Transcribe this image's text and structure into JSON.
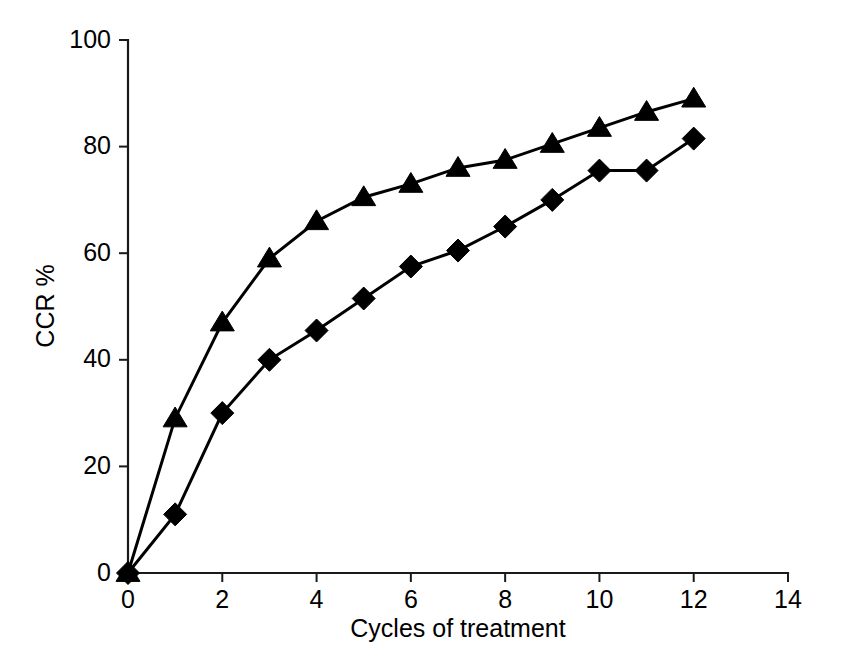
{
  "chart_data": {
    "type": "line",
    "title": "",
    "subtitle": "",
    "xlabel": "Cycles of treatment",
    "ylabel": "CCR %",
    "xlim": [
      0,
      14
    ],
    "ylim": [
      0,
      100
    ],
    "xticks": [
      0,
      2,
      4,
      6,
      8,
      10,
      12,
      14
    ],
    "yticks": [
      0,
      20,
      40,
      60,
      80,
      100
    ],
    "xtick_labels": [
      "0",
      "2",
      "4",
      "6",
      "8",
      "10",
      "12",
      "14"
    ],
    "ytick_labels": [
      "0",
      "20",
      "40",
      "60",
      "80",
      "100"
    ],
    "grid": false,
    "legend": false,
    "legend_position": "none",
    "x": [
      0,
      1,
      2,
      3,
      4,
      5,
      6,
      7,
      8,
      9,
      10,
      11,
      12
    ],
    "series": [
      {
        "name": "Upper curve",
        "marker": "triangle",
        "color": "#000000",
        "values": [
          0,
          29,
          47,
          59,
          66,
          70.5,
          73,
          76,
          77.5,
          80.5,
          83.5,
          86.5,
          89
        ]
      },
      {
        "name": "Lower curve",
        "marker": "diamond",
        "color": "#000000",
        "values": [
          0,
          11,
          30,
          40,
          45.5,
          51.5,
          57.5,
          60.5,
          65,
          70,
          75.5,
          75.5,
          81.5
        ]
      }
    ],
    "annotations": []
  },
  "figure": {
    "background": "#ffffff",
    "axis_color": "#1a1a1a"
  }
}
